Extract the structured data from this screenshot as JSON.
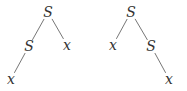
{
  "diagram": {
    "type": "parse-trees",
    "trees": [
      {
        "name": "left-tree",
        "nodes": [
          {
            "id": "l_root",
            "label": "S",
            "x": 48,
            "y": 12
          },
          {
            "id": "l_s",
            "label": "S",
            "x": 29,
            "y": 46
          },
          {
            "id": "l_x1",
            "label": "x",
            "x": 67,
            "y": 45
          },
          {
            "id": "l_x2",
            "label": "x",
            "x": 11,
            "y": 79
          }
        ],
        "edges": [
          [
            "l_root",
            "l_s"
          ],
          [
            "l_root",
            "l_x1"
          ],
          [
            "l_s",
            "l_x2"
          ]
        ]
      },
      {
        "name": "right-tree",
        "nodes": [
          {
            "id": "r_root",
            "label": "S",
            "x": 131,
            "y": 12
          },
          {
            "id": "r_x1",
            "label": "x",
            "x": 113,
            "y": 45
          },
          {
            "id": "r_s",
            "label": "S",
            "x": 151,
            "y": 46
          },
          {
            "id": "r_x2",
            "label": "x",
            "x": 169,
            "y": 79
          }
        ],
        "edges": [
          [
            "r_root",
            "r_x1"
          ],
          [
            "r_root",
            "r_s"
          ],
          [
            "r_s",
            "r_x2"
          ]
        ]
      }
    ],
    "colors": {
      "text": "#333333",
      "edge": "#666666",
      "background": "#ffffff"
    }
  }
}
